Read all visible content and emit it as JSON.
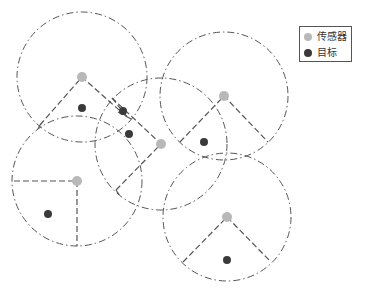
{
  "colors": {
    "sensor": "#b8b8b8",
    "target": "#3a3a3a",
    "circle_stroke": "#555555",
    "sector_stroke": "#555555",
    "legend_border": "#555555"
  },
  "legend": {
    "items": [
      {
        "key": "sensor",
        "label": "传感器"
      },
      {
        "key": "target",
        "label": "目标"
      }
    ]
  },
  "sensors": [
    {
      "id": "s1",
      "x": 82,
      "y": 77,
      "r": 65,
      "sector": [
        [
          40,
          125
        ],
        [
          82,
          77
        ],
        [
          128,
          118
        ]
      ]
    },
    {
      "id": "s2",
      "x": 161,
      "y": 144,
      "r": 66,
      "sector": [
        [
          116,
          190
        ],
        [
          161,
          144
        ],
        [
          112,
          98
        ]
      ]
    },
    {
      "id": "s3",
      "x": 224,
      "y": 96,
      "r": 64,
      "sector": [
        [
          180,
          142
        ],
        [
          224,
          96
        ],
        [
          268,
          142
        ]
      ]
    },
    {
      "id": "s4",
      "x": 77,
      "y": 181,
      "r": 65,
      "sector": [
        [
          14,
          181
        ],
        [
          77,
          181
        ],
        [
          77,
          246
        ]
      ]
    },
    {
      "id": "s5",
      "x": 227,
      "y": 217,
      "r": 64,
      "sector": [
        [
          183,
          262
        ],
        [
          227,
          217
        ],
        [
          271,
          262
        ]
      ]
    }
  ],
  "targets": [
    {
      "id": "t1",
      "x": 82,
      "y": 108
    },
    {
      "id": "t2",
      "x": 123,
      "y": 111
    },
    {
      "id": "t3",
      "x": 129,
      "y": 134
    },
    {
      "id": "t4",
      "x": 204,
      "y": 142
    },
    {
      "id": "t5",
      "x": 48,
      "y": 214
    },
    {
      "id": "t6",
      "x": 227,
      "y": 260
    }
  ],
  "extra_segments": [
    [
      [
        112,
        98
      ],
      [
        128,
        118
      ]
    ],
    [
      [
        118,
        112
      ],
      [
        133,
        120
      ]
    ],
    [
      [
        116,
        190
      ],
      [
        120,
        196
      ]
    ],
    [
      [
        40,
        125
      ],
      [
        38,
        129
      ]
    ]
  ]
}
